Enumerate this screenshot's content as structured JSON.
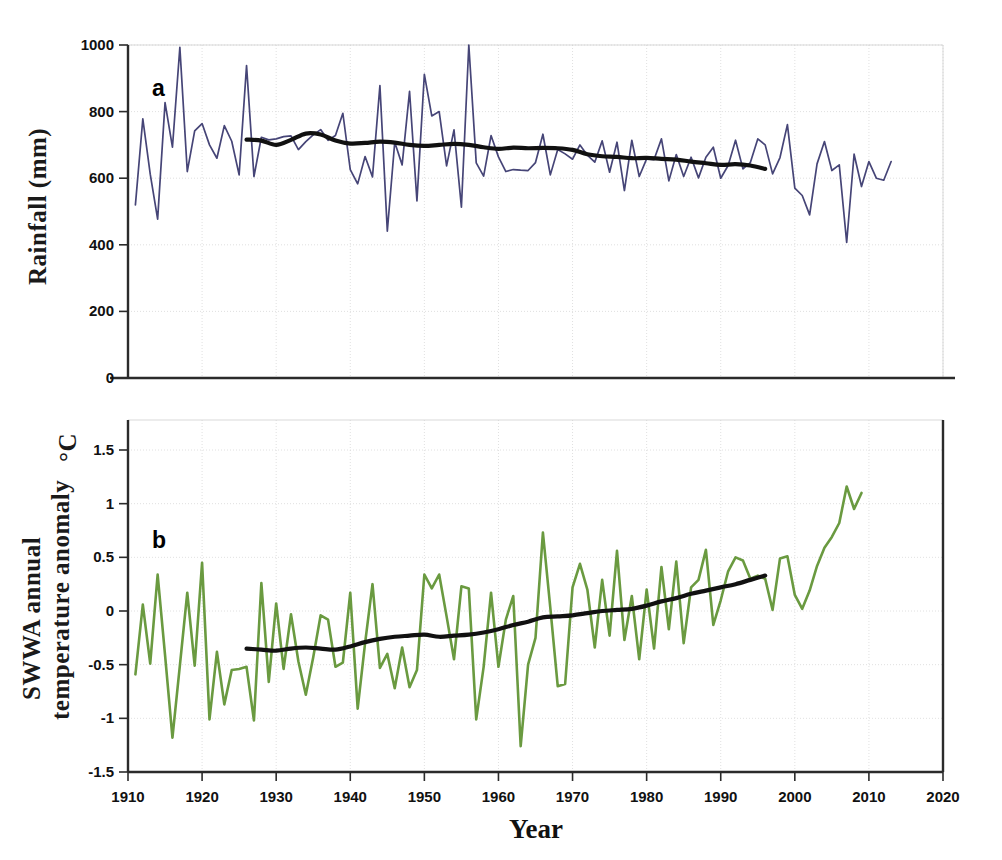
{
  "figure": {
    "xlabel": "Year",
    "panel_a_letter": "a",
    "panel_b_letter": "b",
    "colors": {
      "rainfall_series": "#464577",
      "temperature_series": "#6a9a40",
      "trend_line": "#111111",
      "axis": "#2b2b2b",
      "grid": "#cfcfcf",
      "background": "#ffffff"
    }
  },
  "chart_data": [
    {
      "type": "line",
      "panel": "a",
      "title": "",
      "xlabel": "Year",
      "ylabel": "Rainfall  (mm)",
      "xlim": [
        1910,
        2020
      ],
      "ylim": [
        0,
        1000
      ],
      "xticks": [
        1910,
        1920,
        1930,
        1940,
        1950,
        1960,
        1970,
        1980,
        1990,
        2000,
        2010,
        2020
      ],
      "yticks": [
        0,
        200,
        400,
        600,
        800,
        1000
      ],
      "grid": true,
      "legend": "none",
      "series": [
        {
          "name": "Annual rainfall",
          "color": "#464577",
          "x": [
            1911,
            1912,
            1913,
            1914,
            1915,
            1916,
            1917,
            1918,
            1919,
            1920,
            1921,
            1922,
            1923,
            1924,
            1925,
            1926,
            1927,
            1928,
            1929,
            1930,
            1931,
            1932,
            1933,
            1934,
            1935,
            1936,
            1937,
            1938,
            1939,
            1940,
            1941,
            1942,
            1943,
            1944,
            1945,
            1946,
            1947,
            1948,
            1949,
            1950,
            1951,
            1952,
            1953,
            1954,
            1955,
            1956,
            1957,
            1958,
            1959,
            1960,
            1961,
            1962,
            1963,
            1964,
            1965,
            1966,
            1967,
            1968,
            1969,
            1970,
            1971,
            1972,
            1973,
            1974,
            1975,
            1976,
            1977,
            1978,
            1979,
            1980,
            1981,
            1982,
            1983,
            1984,
            1985,
            1986,
            1987,
            1988,
            1989,
            1990,
            1991,
            1992,
            1993,
            1994,
            1995,
            1996,
            1997,
            1998,
            1999,
            2000,
            2001,
            2002,
            2003,
            2004,
            2005,
            2006,
            2007,
            2008,
            2009,
            2010,
            2011,
            2012,
            2013
          ],
          "values": [
            520,
            778,
            612,
            477,
            827,
            693,
            993,
            620,
            742,
            764,
            700,
            660,
            758,
            711,
            610,
            938,
            605,
            723,
            715,
            718,
            725,
            727,
            686,
            710,
            730,
            746,
            714,
            728,
            795,
            626,
            583,
            665,
            604,
            878,
            441,
            708,
            640,
            861,
            532,
            912,
            787,
            800,
            637,
            745,
            513,
            1000,
            646,
            606,
            728,
            664,
            620,
            626,
            624,
            623,
            647,
            732,
            610,
            686,
            673,
            657,
            700,
            669,
            648,
            712,
            618,
            708,
            563,
            714,
            605,
            658,
            656,
            718,
            592,
            671,
            605,
            663,
            601,
            663,
            693,
            600,
            638,
            714,
            628,
            647,
            718,
            700,
            613,
            662,
            761,
            570,
            548,
            490,
            643,
            710,
            623,
            640,
            407,
            672,
            575,
            650,
            600,
            594,
            650
          ]
        },
        {
          "name": "Smoothed trend",
          "color": "#111111",
          "x": [
            1926,
            1928,
            1930,
            1932,
            1934,
            1936,
            1938,
            1940,
            1942,
            1944,
            1946,
            1948,
            1950,
            1952,
            1954,
            1956,
            1958,
            1960,
            1962,
            1964,
            1966,
            1968,
            1970,
            1972,
            1974,
            1976,
            1978,
            1980,
            1982,
            1984,
            1986,
            1988,
            1990,
            1992,
            1994,
            1996
          ],
          "values": [
            716,
            713,
            700,
            715,
            734,
            731,
            713,
            704,
            706,
            710,
            707,
            700,
            697,
            700,
            703,
            700,
            693,
            688,
            692,
            690,
            691,
            690,
            685,
            672,
            666,
            664,
            660,
            661,
            658,
            656,
            650,
            645,
            640,
            642,
            638,
            628
          ]
        }
      ]
    },
    {
      "type": "line",
      "panel": "b",
      "title": "",
      "xlabel": "Year",
      "ylabel": "SWWA annual temperature anomaly",
      "ylabel_unit": "°C",
      "xlim": [
        1910,
        2020
      ],
      "ylim": [
        -1.5,
        1.5
      ],
      "xticks": [
        1910,
        1920,
        1930,
        1940,
        1950,
        1960,
        1970,
        1980,
        1990,
        2000,
        2010,
        2020
      ],
      "yticks": [
        -1.5,
        -1,
        -0.5,
        0,
        0.5,
        1,
        1.5
      ],
      "ytick_labels": [
        "-1.5",
        "-1",
        "-0.5",
        "0",
        "0.5",
        "1",
        "1.5"
      ],
      "grid": true,
      "legend": "none",
      "series": [
        {
          "name": "SWWA annual temperature anomaly",
          "color": "#6a9a40",
          "x": [
            1911,
            1912,
            1913,
            1914,
            1915,
            1916,
            1917,
            1918,
            1919,
            1920,
            1921,
            1922,
            1923,
            1924,
            1925,
            1926,
            1927,
            1928,
            1929,
            1930,
            1931,
            1932,
            1933,
            1934,
            1935,
            1936,
            1937,
            1938,
            1939,
            1940,
            1941,
            1942,
            1943,
            1944,
            1945,
            1946,
            1947,
            1948,
            1949,
            1950,
            1951,
            1952,
            1953,
            1954,
            1955,
            1956,
            1957,
            1958,
            1959,
            1960,
            1961,
            1962,
            1963,
            1964,
            1965,
            1966,
            1967,
            1968,
            1969,
            1970,
            1971,
            1972,
            1973,
            1974,
            1975,
            1976,
            1977,
            1978,
            1979,
            1980,
            1981,
            1982,
            1983,
            1984,
            1985,
            1986,
            1987,
            1988,
            1989,
            1990,
            1991,
            1992,
            1993,
            1994,
            1995,
            1996,
            1997,
            1998,
            1999,
            2000,
            2001,
            2002,
            2003,
            2004,
            2005,
            2006,
            2007,
            2008,
            2009,
            2010,
            2011,
            2012,
            2013
          ],
          "values": [
            -0.59,
            0.06,
            -0.49,
            0.34,
            -0.41,
            -1.18,
            -0.51,
            0.17,
            -0.51,
            0.45,
            -1.01,
            -0.38,
            -0.87,
            -0.55,
            -0.54,
            -0.52,
            -1.02,
            0.26,
            -0.66,
            0.07,
            -0.54,
            -0.03,
            -0.47,
            -0.78,
            -0.43,
            -0.04,
            -0.08,
            -0.52,
            -0.48,
            0.17,
            -0.91,
            -0.3,
            0.25,
            -0.53,
            -0.4,
            -0.72,
            -0.34,
            -0.71,
            -0.55,
            0.34,
            0.21,
            0.34,
            -0.05,
            -0.45,
            0.23,
            0.21,
            -1.01,
            -0.52,
            0.17,
            -0.52,
            -0.08,
            0.14,
            -1.26,
            -0.5,
            -0.25,
            0.73,
            0.03,
            -0.7,
            -0.68,
            0.22,
            0.44,
            0.2,
            -0.34,
            0.29,
            -0.23,
            0.56,
            -0.27,
            0.14,
            -0.45,
            0.2,
            -0.35,
            0.41,
            -0.17,
            0.46,
            -0.3,
            0.22,
            0.29,
            0.57,
            -0.13,
            0.1,
            0.37,
            0.5,
            0.47,
            0.3,
            0.33,
            0.3,
            0.01,
            0.49,
            0.51,
            0.15,
            0.02,
            0.19,
            0.42,
            0.59,
            0.69,
            0.82,
            1.16,
            0.95,
            1.1
          ]
        },
        {
          "name": "Smoothed trend",
          "color": "#111111",
          "x": [
            1926,
            1928,
            1930,
            1932,
            1934,
            1936,
            1938,
            1940,
            1942,
            1944,
            1946,
            1948,
            1950,
            1952,
            1954,
            1956,
            1958,
            1960,
            1962,
            1964,
            1966,
            1968,
            1970,
            1972,
            1974,
            1976,
            1978,
            1980,
            1982,
            1984,
            1986,
            1988,
            1990,
            1992,
            1994,
            1996
          ],
          "values": [
            -0.35,
            -0.36,
            -0.37,
            -0.35,
            -0.34,
            -0.35,
            -0.36,
            -0.33,
            -0.29,
            -0.26,
            -0.24,
            -0.23,
            -0.22,
            -0.24,
            -0.23,
            -0.22,
            -0.2,
            -0.17,
            -0.13,
            -0.1,
            -0.06,
            -0.05,
            -0.04,
            -0.02,
            0.0,
            0.01,
            0.02,
            0.05,
            0.09,
            0.12,
            0.16,
            0.19,
            0.22,
            0.25,
            0.29,
            0.33
          ]
        }
      ]
    }
  ]
}
